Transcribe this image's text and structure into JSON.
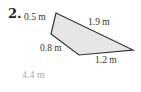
{
  "problem": {
    "number": "2.",
    "figure": {
      "shape": "quadrilateral",
      "fill_color": "#e6e6e6",
      "stroke_color": "#333333",
      "vertices": [
        [
          56,
          13
        ],
        [
          133,
          50
        ],
        [
          79,
          55
        ],
        [
          51,
          34
        ]
      ],
      "side_labels": {
        "top_left": "0.5 m",
        "top_right": "1.9 m",
        "bottom_left": "0.8 m",
        "bottom_right": "1.2 m"
      }
    },
    "answer": "4.4 m",
    "answer_color": "#aaaaaa"
  }
}
